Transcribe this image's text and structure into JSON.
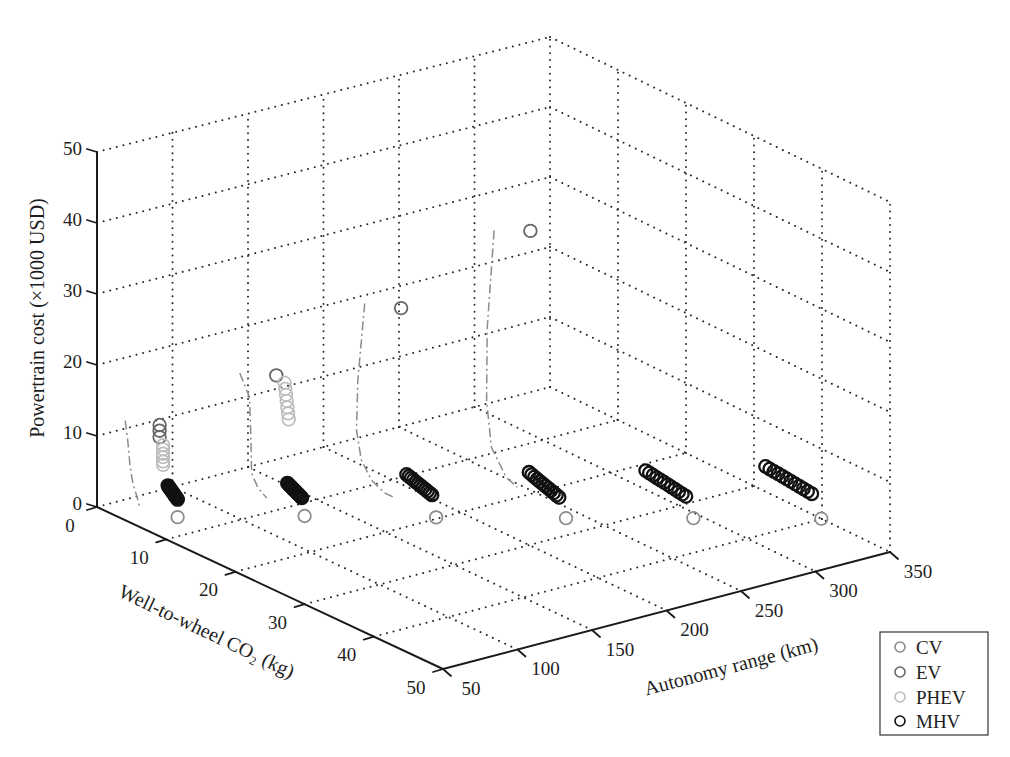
{
  "chart_data": {
    "type": "scatter",
    "projection": "3d",
    "title": "",
    "xlabel": "Autonomy range (km)",
    "ylabel": "Well-to-wheel CO₂ (kg)",
    "zlabel": "Powertrain cost (×1000 USD)",
    "xlim": [
      50,
      350
    ],
    "ylim": [
      0,
      50
    ],
    "zlim": [
      0,
      50
    ],
    "xticks": [
      50,
      100,
      150,
      200,
      250,
      300,
      350
    ],
    "yticks": [
      0,
      10,
      20,
      30,
      40,
      50
    ],
    "zticks": [
      0,
      10,
      20,
      30,
      40,
      50
    ],
    "grid": true,
    "legend_position": "lower right, outside axes",
    "point_format": [
      "autonomy_km",
      "co2_kg",
      "cost_k_usd"
    ],
    "series": [
      {
        "name": "CV",
        "color": "#8a8a8a",
        "marker": "open-circle",
        "marker_edge_width": 1.7,
        "points": [
          [
            75,
            6.2,
            0
          ],
          [
            130,
            12.6,
            0
          ],
          [
            185,
            19.7,
            0
          ],
          [
            240,
            26.6,
            0
          ],
          [
            295,
            33.2,
            0
          ],
          [
            350,
            39.9,
            0
          ]
        ]
      },
      {
        "name": "EV",
        "color": "#666666",
        "marker": "open-circle",
        "marker_edge_width": 1.8,
        "points": [
          [
            75,
            3.6,
            11.8
          ],
          [
            75,
            3.6,
            11.0
          ],
          [
            75,
            3.6,
            10.1
          ],
          [
            130,
            8.5,
            18.0
          ],
          [
            185,
            14.6,
            27.3
          ],
          [
            240,
            21.4,
            38.4
          ]
        ]
      },
      {
        "name": "PHEV",
        "color": "#bdbdbd",
        "marker": "open-circle",
        "marker_edge_width": 1.7,
        "points": [
          [
            75,
            4.1,
            9.2
          ],
          [
            75,
            4.1,
            8.6
          ],
          [
            75,
            4.1,
            8.0
          ],
          [
            75,
            4.1,
            7.5
          ],
          [
            75,
            4.1,
            6.9
          ],
          [
            75,
            4.1,
            6.4
          ],
          [
            130,
            9.7,
            17.5
          ],
          [
            130,
            9.8,
            16.7
          ],
          [
            130,
            9.9,
            15.9
          ],
          [
            130,
            10.0,
            15.1
          ],
          [
            130,
            10.1,
            14.2
          ],
          [
            130,
            10.2,
            13.4
          ],
          [
            130,
            10.3,
            12.6
          ]
        ]
      },
      {
        "name": "MHV",
        "color": "#111111",
        "marker": "open-circle",
        "marker_edge_width": 2.3,
        "points": [
          [
            75,
            4.8,
            3.8
          ],
          [
            75,
            4.93,
            3.68
          ],
          [
            75,
            5.05,
            3.56
          ],
          [
            75,
            5.18,
            3.45
          ],
          [
            75,
            5.31,
            3.33
          ],
          [
            75,
            5.44,
            3.21
          ],
          [
            75,
            5.56,
            3.09
          ],
          [
            75,
            5.69,
            2.97
          ],
          [
            75,
            5.82,
            2.85
          ],
          [
            75,
            5.95,
            2.74
          ],
          [
            75,
            6.07,
            2.62
          ],
          [
            75,
            6.2,
            2.5
          ],
          [
            130,
            10.1,
            3.5
          ],
          [
            130,
            10.29,
            3.4
          ],
          [
            130,
            10.48,
            3.3
          ],
          [
            130,
            10.67,
            3.2
          ],
          [
            130,
            10.86,
            3.1
          ],
          [
            130,
            11.05,
            3.0
          ],
          [
            130,
            11.25,
            2.9
          ],
          [
            130,
            11.44,
            2.8
          ],
          [
            130,
            11.63,
            2.7
          ],
          [
            130,
            11.82,
            2.6
          ],
          [
            130,
            12.01,
            2.5
          ],
          [
            130,
            12.2,
            2.4
          ],
          [
            185,
            15.4,
            4.1
          ],
          [
            185,
            15.74,
            3.99
          ],
          [
            185,
            16.07,
            3.88
          ],
          [
            185,
            16.41,
            3.77
          ],
          [
            185,
            16.75,
            3.66
          ],
          [
            185,
            17.08,
            3.55
          ],
          [
            185,
            17.42,
            3.45
          ],
          [
            185,
            17.75,
            3.34
          ],
          [
            185,
            18.09,
            3.23
          ],
          [
            185,
            18.43,
            3.12
          ],
          [
            185,
            18.76,
            3.01
          ],
          [
            185,
            19.1,
            2.9
          ],
          [
            240,
            21.2,
            4.0
          ],
          [
            240,
            21.6,
            3.86
          ],
          [
            240,
            22.0,
            3.73
          ],
          [
            240,
            22.4,
            3.59
          ],
          [
            240,
            22.8,
            3.45
          ],
          [
            240,
            23.2,
            3.32
          ],
          [
            240,
            23.6,
            3.18
          ],
          [
            240,
            24.0,
            3.05
          ],
          [
            240,
            24.4,
            2.91
          ],
          [
            240,
            24.8,
            2.77
          ],
          [
            240,
            25.2,
            2.64
          ],
          [
            240,
            25.6,
            2.5
          ],
          [
            295,
            26.2,
            3.5
          ],
          [
            295,
            26.74,
            3.42
          ],
          [
            295,
            27.27,
            3.34
          ],
          [
            295,
            27.81,
            3.25
          ],
          [
            295,
            28.35,
            3.17
          ],
          [
            295,
            28.88,
            3.09
          ],
          [
            295,
            29.42,
            3.01
          ],
          [
            295,
            29.95,
            2.93
          ],
          [
            295,
            30.49,
            2.85
          ],
          [
            295,
            31.03,
            2.76
          ],
          [
            295,
            31.56,
            2.68
          ],
          [
            295,
            32.1,
            2.6
          ],
          [
            350,
            31.7,
            3.6
          ],
          [
            350,
            32.32,
            3.54
          ],
          [
            350,
            32.94,
            3.47
          ],
          [
            350,
            33.55,
            3.41
          ],
          [
            350,
            34.17,
            3.35
          ],
          [
            350,
            34.79,
            3.28
          ],
          [
            350,
            35.41,
            3.22
          ],
          [
            350,
            36.03,
            3.15
          ],
          [
            350,
            36.65,
            3.09
          ],
          [
            350,
            37.26,
            3.03
          ],
          [
            350,
            37.88,
            2.96
          ],
          [
            350,
            38.5,
            2.9
          ]
        ]
      }
    ],
    "curves": [
      {
        "style": "dash-dot",
        "color": "#8c8c8c",
        "points": [
          [
            60,
            1.9,
            12.5
          ],
          [
            60,
            2.3,
            9.5
          ],
          [
            60,
            2.6,
            6.3
          ],
          [
            60,
            3.0,
            4.2
          ],
          [
            60,
            3.6,
            2.5
          ],
          [
            60,
            4.0,
            1.2
          ]
        ]
      },
      {
        "style": "dash-dot",
        "color": "#8c8c8c",
        "points": [
          [
            130,
            3.2,
            15.9
          ],
          [
            130,
            4.6,
            13.1
          ],
          [
            130,
            4.8,
            7.5
          ],
          [
            130,
            4.9,
            2.5
          ],
          [
            130,
            5.8,
            0.9
          ],
          [
            130,
            7.1,
            0
          ]
        ]
      },
      {
        "style": "dash-dot",
        "color": "#8c8c8c",
        "points": [
          [
            185,
            9.3,
            25.5
          ],
          [
            185,
            8.3,
            14.1
          ],
          [
            185,
            8.1,
            7.0
          ],
          [
            185,
            8.8,
            3.1
          ],
          [
            185,
            10.3,
            0.9
          ],
          [
            185,
            12.2,
            0
          ],
          [
            185,
            13.5,
            0
          ]
        ]
      },
      {
        "style": "dash-dot",
        "color": "#8c8c8c",
        "points": [
          [
            240,
            16.1,
            36.0
          ],
          [
            240,
            15.1,
            21.6
          ],
          [
            240,
            15.0,
            11.3
          ],
          [
            240,
            15.7,
            5.0
          ],
          [
            240,
            17.9,
            1.7
          ],
          [
            240,
            19.5,
            1.1
          ]
        ]
      }
    ]
  }
}
